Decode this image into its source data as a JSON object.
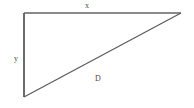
{
  "figure": {
    "kind": "right-triangle-diagram",
    "background_color": "#ffffff",
    "width": 194,
    "height": 108
  },
  "labels": {
    "top_side": "x",
    "left_side": "y",
    "hypotenuse": "D"
  },
  "geometry": {
    "stroke_color_top": "#8a8a8a",
    "stroke_color_left": "#6b6b6b",
    "stroke_color_hypotenuse": "#5a5a5a",
    "stroke_width": 1,
    "vertices": {
      "top_left": [
        24,
        13
      ],
      "top_right": [
        181,
        13
      ],
      "bottom_left": [
        24,
        97
      ]
    }
  }
}
